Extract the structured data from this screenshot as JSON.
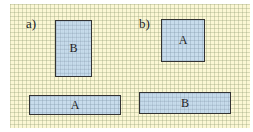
{
  "diagram": {
    "part_a": {
      "label": "a)",
      "shapes": [
        {
          "name": "B",
          "label": "B",
          "orientation": "vertical"
        },
        {
          "name": "A",
          "label": "A",
          "orientation": "horizontal"
        }
      ]
    },
    "part_b": {
      "label": "b)",
      "shapes": [
        {
          "name": "A",
          "label": "A",
          "orientation": "square"
        },
        {
          "name": "B",
          "label": "B",
          "orientation": "horizontal"
        }
      ]
    },
    "colors": {
      "paper": "#fbf7d4",
      "shape_fill": "#bed7f0",
      "border": "#333333"
    }
  }
}
